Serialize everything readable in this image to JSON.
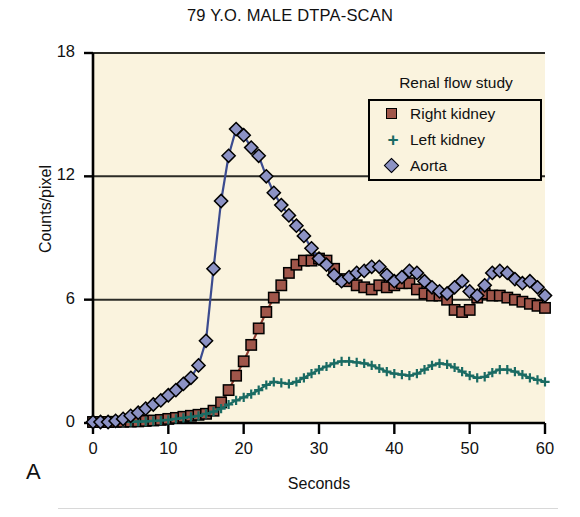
{
  "figure": {
    "panel_label": "A",
    "background_color": "#ffffff",
    "plot_background_color": "#faf3de"
  },
  "legend": {
    "title": "Renal flow study",
    "position": "top-right-inside",
    "entries": [
      {
        "label": "Right kidney",
        "marker": "square",
        "color": "#a0564a",
        "icon": "square-marker-icon"
      },
      {
        "label": "Left kidney",
        "marker": "plus",
        "color": "#1a6b63",
        "icon": "plus-marker-icon"
      },
      {
        "label": "Aorta",
        "marker": "diamond",
        "color": "#8c92c4",
        "icon": "diamond-marker-icon"
      }
    ]
  },
  "chart_data": {
    "type": "line",
    "title": "79 Y.O. MALE DTPA-SCAN",
    "subtitle": "",
    "xlabel": "Seconds",
    "ylabel": "Counts/pixel",
    "xlim": [
      0,
      60
    ],
    "ylim": [
      0,
      18
    ],
    "xticks": [
      0,
      10,
      20,
      30,
      40,
      50,
      60
    ],
    "yticks": [
      0,
      6,
      12,
      18
    ],
    "grid": "horizontal",
    "x": [
      0,
      1,
      2,
      3,
      4,
      5,
      6,
      7,
      8,
      9,
      10,
      11,
      12,
      13,
      14,
      15,
      16,
      17,
      18,
      19,
      20,
      21,
      22,
      23,
      24,
      25,
      26,
      27,
      28,
      29,
      30,
      31,
      32,
      33,
      34,
      35,
      36,
      37,
      38,
      39,
      40,
      41,
      42,
      43,
      44,
      45,
      46,
      47,
      48,
      49,
      50,
      51,
      52,
      53,
      54,
      55,
      56,
      57,
      58,
      59,
      60
    ],
    "series": [
      {
        "name": "Right kidney",
        "marker": "square",
        "color": "#a0564a",
        "line_color": "#8e3b2f",
        "values": [
          0.05,
          0.05,
          0.05,
          0.06,
          0.06,
          0.07,
          0.08,
          0.1,
          0.12,
          0.15,
          0.2,
          0.25,
          0.3,
          0.35,
          0.4,
          0.45,
          0.6,
          1.0,
          1.6,
          2.3,
          3.0,
          3.8,
          4.6,
          5.4,
          6.1,
          6.7,
          7.3,
          7.7,
          7.9,
          7.9,
          8.0,
          7.9,
          7.5,
          7.0,
          6.9,
          6.7,
          6.6,
          6.5,
          6.7,
          6.6,
          6.7,
          6.8,
          6.8,
          6.5,
          6.3,
          6.2,
          6.2,
          6.0,
          5.5,
          5.4,
          5.5,
          6.1,
          6.3,
          6.2,
          6.2,
          6.1,
          6.0,
          5.9,
          5.8,
          5.7,
          5.6
        ]
      },
      {
        "name": "Left kidney",
        "marker": "plus",
        "color": "#1a6b63",
        "line_color": "#1a6b63",
        "values": [
          0.05,
          0.05,
          0.05,
          0.05,
          0.06,
          0.06,
          0.07,
          0.08,
          0.1,
          0.12,
          0.15,
          0.2,
          0.25,
          0.3,
          0.35,
          0.45,
          0.55,
          0.7,
          0.9,
          1.1,
          1.25,
          1.4,
          1.6,
          1.85,
          2.0,
          1.95,
          1.9,
          2.0,
          2.2,
          2.4,
          2.6,
          2.75,
          2.9,
          3.0,
          3.0,
          2.95,
          2.9,
          2.8,
          2.65,
          2.5,
          2.4,
          2.35,
          2.3,
          2.4,
          2.6,
          2.8,
          2.9,
          2.85,
          2.7,
          2.5,
          2.3,
          2.2,
          2.25,
          2.45,
          2.6,
          2.6,
          2.5,
          2.35,
          2.2,
          2.1,
          2.0
        ]
      },
      {
        "name": "Aorta",
        "marker": "diamond",
        "color": "#8c92c4",
        "line_color": "#3b4b8f",
        "values": [
          0.05,
          0.05,
          0.05,
          0.1,
          0.2,
          0.35,
          0.5,
          0.7,
          0.9,
          1.1,
          1.35,
          1.6,
          1.9,
          2.2,
          2.8,
          4.0,
          7.5,
          10.8,
          13.0,
          14.3,
          14.0,
          13.4,
          13.0,
          12.0,
          11.2,
          10.6,
          10.1,
          9.6,
          9.1,
          8.5,
          8.0,
          7.7,
          7.2,
          6.9,
          7.1,
          7.3,
          7.4,
          7.6,
          7.6,
          7.2,
          6.9,
          7.1,
          7.4,
          7.3,
          6.9,
          6.6,
          6.4,
          6.3,
          6.6,
          6.9,
          6.4,
          6.2,
          6.7,
          7.3,
          7.4,
          7.3,
          7.0,
          6.8,
          6.9,
          6.6,
          6.2
        ]
      }
    ]
  }
}
